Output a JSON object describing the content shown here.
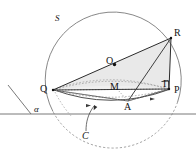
{
  "figure": {
    "width": 196,
    "height": 149,
    "background_color": "#ffffff",
    "stroke_color": "#4a4a4a",
    "dark_stroke_color": "#2b2b2b",
    "shade_color": "#e9e9e9",
    "label_color": "#141414"
  },
  "labels": {
    "sphere": "S",
    "center": "O",
    "vertex_q": "Q",
    "vertex_r": "R",
    "vertex_p": "P",
    "vertex_gamma": "Γ",
    "midpoint_m": "M",
    "point_a": "A",
    "plane": "α",
    "curve": "C"
  },
  "geometry": {
    "sphere_circle": {
      "cx": 118,
      "cy": 72,
      "r": 68
    },
    "points": {
      "O": {
        "x": 113.5,
        "y": 63.5
      },
      "Q": {
        "x": 53,
        "y": 90
      },
      "R": {
        "x": 171,
        "y": 38
      },
      "P": {
        "x": 169,
        "y": 89
      },
      "M": {
        "x": 117,
        "y": 89
      },
      "A": {
        "x": 128,
        "y": 101
      }
    },
    "plane_line": {
      "x1": 0,
      "y1": 114,
      "x2": 196,
      "y2": 114
    },
    "plane_corner": {
      "x1": 8,
      "y1": 85,
      "x2": 31,
      "y2": 114
    },
    "upper_ellipse": {
      "cx": 111,
      "cy": 89,
      "rx": 58,
      "ry": 11
    },
    "lower_ellipse": {
      "cx": 111,
      "cy": 89,
      "rx": 58,
      "ry": 14
    },
    "right_angle_mark": {
      "x": 160,
      "y": 80,
      "size": 8
    }
  }
}
